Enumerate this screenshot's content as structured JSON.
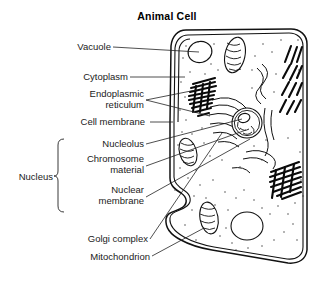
{
  "figure": {
    "title": "Animal Cell",
    "type": "labeled-biological-diagram",
    "background_color": "#ffffff",
    "ink_color": "#111111"
  },
  "labels": [
    {
      "id": "vacuole",
      "text": "Vacuole",
      "lines": [
        "Vacuole"
      ]
    },
    {
      "id": "cytoplasm",
      "text": "Cytoplasm",
      "lines": [
        "Cytoplasm"
      ]
    },
    {
      "id": "er",
      "text": "Endoplasmic reticulum",
      "lines": [
        "Endoplasmic",
        "reticulum"
      ]
    },
    {
      "id": "cell-membrane",
      "text": "Cell membrane",
      "lines": [
        "Cell membrane"
      ]
    },
    {
      "id": "nucleolus",
      "text": "Nucleolus",
      "lines": [
        "Nucleolus"
      ]
    },
    {
      "id": "chromosome",
      "text": "Chromosome material",
      "lines": [
        "Chromosome",
        "material"
      ]
    },
    {
      "id": "nuclear-membrane",
      "text": "Nuclear membrane",
      "lines": [
        "Nuclear",
        "membrane"
      ]
    },
    {
      "id": "golgi",
      "text": "Golgi complex",
      "lines": [
        "Golgi complex"
      ]
    },
    {
      "id": "mitochondrion",
      "text": "Mitochondrion",
      "lines": [
        "Mitochondrion"
      ]
    }
  ],
  "group": {
    "id": "nucleus-group",
    "text": "Nucleus",
    "members": [
      "Nucleolus",
      "Chromosome material",
      "Nuclear membrane"
    ]
  },
  "text": {
    "title": "Animal Cell",
    "vacuole": "Vacuole",
    "cytoplasm": "Cytoplasm",
    "er_line1": "Endoplasmic",
    "er_line2": "reticulum",
    "cell_membrane": "Cell membrane",
    "nucleolus": "Nucleolus",
    "chromosome_line1": "Chromosome",
    "chromosome_line2": "material",
    "nuclear_line1": "Nuclear",
    "nuclear_line2": "membrane",
    "nucleus": "Nucleus",
    "golgi": "Golgi complex",
    "mitochondrion": "Mitochondrion"
  }
}
